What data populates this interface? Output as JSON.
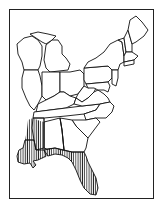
{
  "map": {
    "subject": "Eastern United States range map",
    "region_hatched": "Gulf Coast range",
    "colors": {
      "ink": "#111111",
      "background": "#ffffff"
    },
    "hatched_areas": [
      "western Mississippi",
      "southern Louisiana",
      "southern Alabama coast",
      "Florida panhandle",
      "peninsular Florida"
    ],
    "hatch_pattern": "vertical-lines"
  }
}
